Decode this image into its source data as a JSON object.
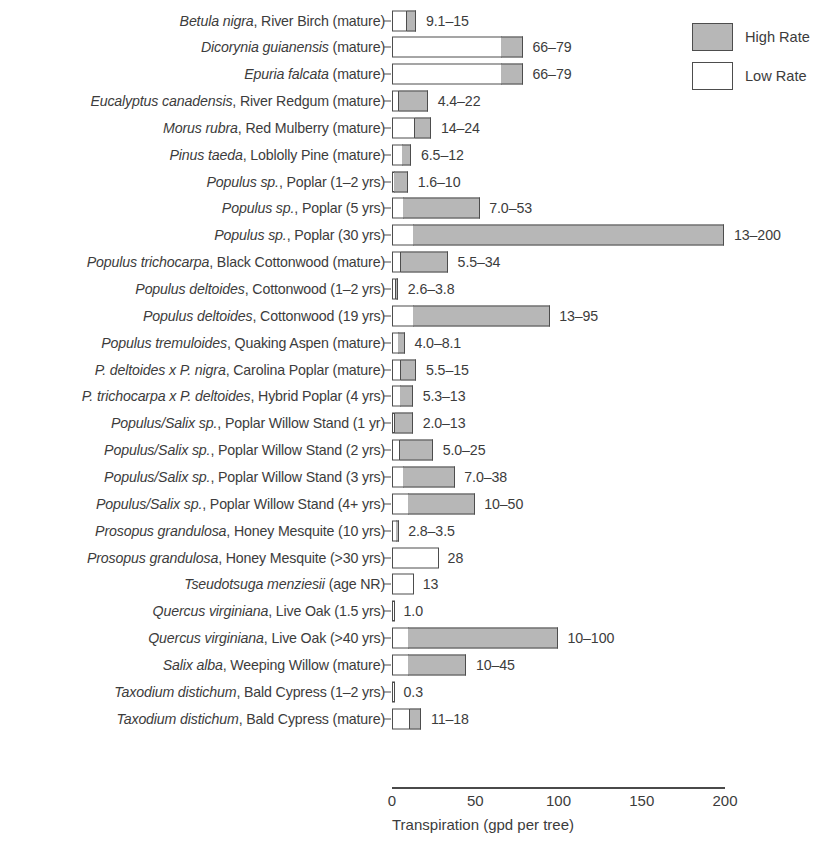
{
  "chart_data": {
    "type": "bar",
    "orientation": "horizontal",
    "title": "",
    "xlabel": "Transpiration (gpd per tree)",
    "ylabel": "",
    "xlim": [
      0,
      200
    ],
    "xticks": [
      0,
      50,
      100,
      150,
      200
    ],
    "xtick_labels": [
      "0",
      "50",
      "100",
      "150",
      "200"
    ],
    "grid": false,
    "legend": {
      "position": "top-right",
      "entries": [
        {
          "label": "High Rate",
          "color": "#b7b7b7",
          "key": "high"
        },
        {
          "label": "Low Rate",
          "color": "#ffffff",
          "key": "low"
        }
      ]
    },
    "categories": [
      "Betula nigra, River Birch (mature)",
      "Dicorynia guianensis (mature)",
      "Epuria falcata (mature)",
      "Eucalyptus canadensis, River Redgum (mature)",
      "Morus rubra, Red Mulberry (mature)",
      "Pinus taeda, Loblolly Pine (mature)",
      "Populus sp., Poplar (1–2 yrs)",
      "Populus sp., Poplar (5 yrs)",
      "Populus sp., Poplar (30 yrs)",
      "Populus trichocarpa, Black Cottonwood (mature)",
      "Populus deltoides, Cottonwood (1–2 yrs)",
      "Populus deltoides, Cottonwood (19 yrs)",
      "Populus tremuloides, Quaking Aspen (mature)",
      "P. deltoides x P. nigra, Carolina Poplar (mature)",
      "P. trichocarpa x P. deltoides, Hybrid Poplar (4 yrs)",
      "Populus/Salix sp., Poplar Willow Stand (1 yr)",
      "Populus/Salix sp., Poplar Willow Stand (2 yrs)",
      "Populus/Salix sp., Poplar Willow Stand (3 yrs)",
      "Populus/Salix sp., Poplar Willow Stand (4+ yrs)",
      "Prosopus grandulosa, Honey Mesquite (10 yrs)",
      "Prosopus grandulosa, Honey Mesquite (>30 yrs)",
      "Tseudotsuga menziesii (age NR)",
      "Quercus virginiana, Live Oak (1.5 yrs)",
      "Quercus virginiana, Live Oak (>40 yrs)",
      "Salix alba, Weeping Willow (mature)",
      "Taxodium distichum, Bald Cypress (1–2 yrs)",
      "Taxodium distichum, Bald Cypress (mature)"
    ],
    "series": [
      {
        "name": "Low Rate",
        "values": [
          9.1,
          66,
          66,
          4.4,
          14,
          6.5,
          1.6,
          7.0,
          13,
          5.5,
          2.6,
          13,
          4.0,
          5.5,
          5.3,
          2.0,
          5.0,
          7.0,
          10,
          2.8,
          28,
          13,
          1.0,
          10,
          10,
          0.3,
          11
        ]
      },
      {
        "name": "High Rate",
        "values": [
          15,
          79,
          79,
          22,
          24,
          12,
          10,
          53,
          200,
          34,
          3.8,
          95,
          8.1,
          15,
          13,
          13,
          25,
          38,
          50,
          3.5,
          null,
          null,
          null,
          100,
          45,
          null,
          18
        ]
      }
    ],
    "rows": [
      {
        "sci": "Betula nigra",
        "rest": ", River Birch (mature)",
        "low": 9.1,
        "high": 15,
        "value_label": "9.1–15"
      },
      {
        "sci": "Dicorynia guianensis",
        "rest": " (mature)",
        "low": 66,
        "high": 79,
        "value_label": "66–79"
      },
      {
        "sci": "Epuria falcata",
        "rest": " (mature)",
        "low": 66,
        "high": 79,
        "value_label": "66–79"
      },
      {
        "sci": "Eucalyptus canadensis",
        "rest": ", River Redgum (mature)",
        "low": 4.4,
        "high": 22,
        "value_label": "4.4–22"
      },
      {
        "sci": "Morus rubra",
        "rest": ", Red Mulberry (mature)",
        "low": 14,
        "high": 24,
        "value_label": "14–24"
      },
      {
        "sci": "Pinus taeda",
        "rest": ", Loblolly Pine (mature)",
        "low": 6.5,
        "high": 12,
        "value_label": "6.5–12"
      },
      {
        "sci": "Populus sp.",
        "rest": ", Poplar (1–2 yrs)",
        "low": 1.6,
        "high": 10,
        "value_label": "1.6–10"
      },
      {
        "sci": "Populus sp.",
        "rest": ", Poplar (5 yrs)",
        "low": 7.0,
        "high": 53,
        "value_label": "7.0–53"
      },
      {
        "sci": "Populus sp.",
        "rest": ", Poplar (30 yrs)",
        "low": 13,
        "high": 200,
        "value_label": "13–200"
      },
      {
        "sci": "Populus trichocarpa",
        "rest": ", Black Cottonwood (mature)",
        "low": 5.5,
        "high": 34,
        "value_label": "5.5–34"
      },
      {
        "sci": "Populus deltoides",
        "rest": ", Cottonwood (1–2 yrs)",
        "low": 2.6,
        "high": 3.8,
        "value_label": "2.6–3.8"
      },
      {
        "sci": "Populus deltoides",
        "rest": ", Cottonwood (19 yrs)",
        "low": 13,
        "high": 95,
        "value_label": "13–95"
      },
      {
        "sci": "Populus tremuloides",
        "rest": ", Quaking Aspen (mature)",
        "low": 4.0,
        "high": 8.1,
        "value_label": "4.0–8.1"
      },
      {
        "sci": "P. deltoides x P. nigra",
        "rest": ", Carolina Poplar (mature)",
        "low": 5.5,
        "high": 15,
        "value_label": "5.5–15"
      },
      {
        "sci": "P. trichocarpa x P. deltoides",
        "rest": ", Hybrid Poplar (4 yrs)",
        "low": 5.3,
        "high": 13,
        "value_label": "5.3–13"
      },
      {
        "sci": "Populus/Salix sp.",
        "rest": ", Poplar Willow Stand (1 yr)",
        "low": 2.0,
        "high": 13,
        "value_label": "2.0–13"
      },
      {
        "sci": "Populus/Salix sp.",
        "rest": ", Poplar Willow Stand (2 yrs)",
        "low": 5.0,
        "high": 25,
        "value_label": "5.0–25"
      },
      {
        "sci": "Populus/Salix sp.",
        "rest": ", Poplar Willow Stand (3 yrs)",
        "low": 7.0,
        "high": 38,
        "value_label": "7.0–38"
      },
      {
        "sci": "Populus/Salix sp.",
        "rest": ", Poplar Willow Stand (4+ yrs)",
        "low": 10,
        "high": 50,
        "value_label": "10–50"
      },
      {
        "sci": "Prosopus grandulosa",
        "rest": ", Honey Mesquite (10 yrs)",
        "low": 2.8,
        "high": 3.5,
        "value_label": "2.8–3.5"
      },
      {
        "sci": "Prosopus grandulosa",
        "rest": ", Honey Mesquite (>30 yrs)",
        "low": 28,
        "high": null,
        "value_label": "28"
      },
      {
        "sci": "Tseudotsuga menziesii",
        "rest": " (age NR)",
        "low": 13,
        "high": null,
        "value_label": "13"
      },
      {
        "sci": "Quercus virginiana",
        "rest": ", Live Oak (1.5 yrs)",
        "low": 1.0,
        "high": null,
        "value_label": "1.0"
      },
      {
        "sci": "Quercus virginiana",
        "rest": ", Live Oak (>40 yrs)",
        "low": 10,
        "high": 100,
        "value_label": "10–100"
      },
      {
        "sci": "Salix alba",
        "rest": ", Weeping Willow (mature)",
        "low": 10,
        "high": 45,
        "value_label": "10–45"
      },
      {
        "sci": "Taxodium distichum",
        "rest": ", Bald Cypress (1–2 yrs)",
        "low": 0.3,
        "high": null,
        "value_label": "0.3"
      },
      {
        "sci": "Taxodium distichum",
        "rest": ", Bald Cypress (mature)",
        "low": 11,
        "high": 18,
        "value_label": "11–18"
      }
    ]
  },
  "colors": {
    "high_rate": "#b7b7b7",
    "low_rate": "#ffffff",
    "outline": "#4d4d4d",
    "text": "#3c3c3c",
    "axis": "#4a4a4a"
  }
}
